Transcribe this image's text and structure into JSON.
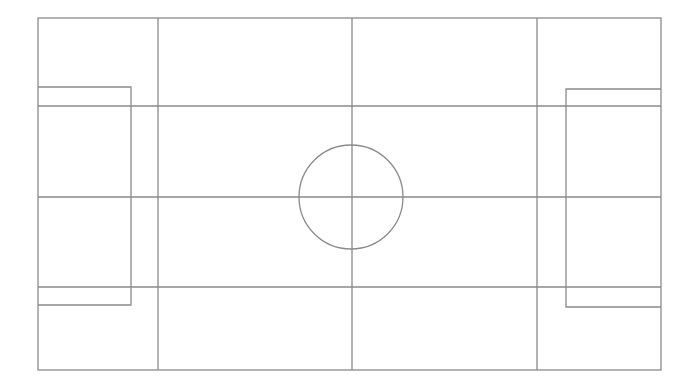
{
  "diagram": {
    "type": "field-layout",
    "stroke_color": "#8a8a8a",
    "background": "#ffffff",
    "outer_boundary": {
      "x1": 38,
      "y1": 18,
      "x2": 661,
      "y2": 370
    },
    "vertical_lines": [
      158,
      352,
      537
    ],
    "horizontal_lines": [
      106,
      197,
      287
    ],
    "left_box": {
      "x1": 38,
      "y1": 87,
      "x2": 131,
      "y2": 305
    },
    "right_box": {
      "x1": 566,
      "y1": 89,
      "x2": 661,
      "y2": 307
    },
    "center_circle": {
      "cx": 351,
      "cy": 197,
      "r": 52
    }
  }
}
